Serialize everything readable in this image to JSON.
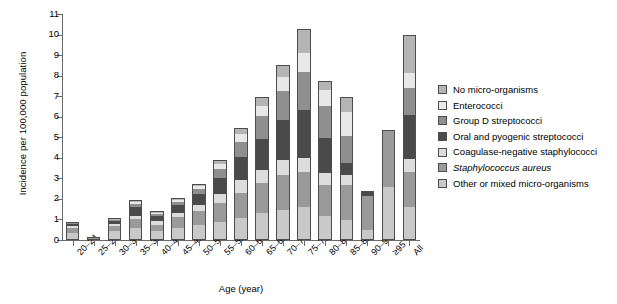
{
  "chart_data": {
    "type": "bar",
    "subtype": "stacked-bar",
    "title": "",
    "xlabel": "Age (year)",
    "ylabel": "Incidence per 100,000 population",
    "ylim": [
      0,
      11
    ],
    "yticks": [
      0,
      1,
      2,
      3,
      4,
      5,
      6,
      7,
      8,
      9,
      10,
      11
    ],
    "grid": false,
    "legend_position": "right",
    "categories": [
      "20–24",
      "25–29",
      "30–34",
      "35–39",
      "40–44",
      "45–49",
      "50–54",
      "55–59",
      "60–64",
      "65–69",
      "70–74",
      "75–79",
      "80–84",
      "85–89",
      "90–94",
      "≥95",
      "All"
    ],
    "series": [
      {
        "name": "Other or mixed micro-organisms",
        "color": "#c9c9c9",
        "values": [
          0.35,
          0.05,
          0.42,
          0.55,
          0.4,
          0.55,
          0.7,
          0.85,
          1.05,
          1.3,
          1.45,
          1.55,
          1.15,
          0.95,
          0.45,
          2.6,
          1.55
        ]
      },
      {
        "name": "Staphylococcus aureus",
        "color": "#9a9a9a",
        "values": [
          0.25,
          0.05,
          0.3,
          0.45,
          0.35,
          0.55,
          0.7,
          0.95,
          1.25,
          1.45,
          1.7,
          1.75,
          1.5,
          1.7,
          1.75,
          2.75,
          1.75
        ]
      },
      {
        "name": "Coagulase-negative staphylococci",
        "color": "#dcdcdc",
        "values": [
          0.1,
          0.02,
          0.08,
          0.2,
          0.2,
          0.25,
          0.3,
          0.45,
          0.6,
          0.65,
          0.75,
          0.7,
          0.6,
          0.5,
          0.0,
          0.0,
          0.65
        ]
      },
      {
        "name": "Oral and pyogenic streptococci",
        "color": "#4a4a4a",
        "values": [
          0.12,
          0.02,
          0.15,
          0.45,
          0.25,
          0.4,
          0.55,
          0.8,
          1.15,
          1.55,
          1.95,
          2.35,
          1.75,
          0.6,
          0.2,
          0.0,
          2.15
        ]
      },
      {
        "name": "Group D streptococci",
        "color": "#8f8f8f",
        "values": [
          0.03,
          0.01,
          0.05,
          0.15,
          0.1,
          0.15,
          0.25,
          0.45,
          0.75,
          1.1,
          1.45,
          1.85,
          1.55,
          1.35,
          0.0,
          0.0,
          1.3
        ]
      },
      {
        "name": "Enterococci",
        "color": "#e8e8e8",
        "values": [
          0.02,
          0.01,
          0.03,
          0.08,
          0.06,
          0.1,
          0.15,
          0.25,
          0.4,
          0.5,
          0.7,
          0.95,
          0.8,
          1.15,
          0.0,
          0.0,
          0.75
        ]
      },
      {
        "name": "No micro-organisms",
        "color": "#b5b5b5",
        "values": [
          0.03,
          0.01,
          0.02,
          0.07,
          0.04,
          0.05,
          0.1,
          0.15,
          0.25,
          0.4,
          0.5,
          1.1,
          0.4,
          0.7,
          0.0,
          0.0,
          1.85
        ]
      }
    ],
    "totals": [
      0.9,
      0.17,
      1.05,
      1.95,
      1.4,
      2.05,
      2.75,
      3.9,
      5.45,
      6.95,
      8.5,
      10.25,
      7.75,
      6.95,
      2.4,
      5.35,
      10.0
    ]
  },
  "legend": {
    "items": [
      {
        "label": "No micro-organisms",
        "color": "#b5b5b5",
        "italic": false
      },
      {
        "label": "Enterococci",
        "color": "#e8e8e8",
        "italic": false
      },
      {
        "label": "Group D streptococci",
        "color": "#8f8f8f",
        "italic": false
      },
      {
        "label": "Oral and pyogenic streptococci",
        "color": "#4a4a4a",
        "italic": false
      },
      {
        "label": "Coagulase-negative staphylococci",
        "color": "#dcdcdc",
        "italic": false
      },
      {
        "label": "Staphylococcus aureus",
        "color": "#9a9a9a",
        "italic": true
      },
      {
        "label": "Other or mixed micro-organisms",
        "color": "#c9c9c9",
        "italic": false
      }
    ]
  }
}
